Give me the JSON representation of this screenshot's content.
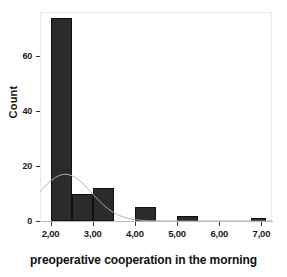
{
  "chart_data": {
    "type": "bar",
    "title": "",
    "subtitle": "",
    "xlabel": "preoperative cooperation in the morning",
    "ylabel": "Count",
    "xlim": [
      1.75,
      7.25
    ],
    "ylim": [
      0,
      76
    ],
    "grid": false,
    "legend": null,
    "bin_width": 0.5,
    "categories": [
      "2,00",
      "2,50",
      "3,00",
      "3,50",
      "4,00",
      "4,50",
      "5,00",
      "5,50",
      "6,00",
      "6,50",
      "7,00"
    ],
    "bins": [
      {
        "label": "2,00",
        "bin_start": 2.0,
        "bin_end": 2.5,
        "value": 74
      },
      {
        "label": "2,50",
        "bin_start": 2.5,
        "bin_end": 3.0,
        "value": 10
      },
      {
        "label": "3,00",
        "bin_start": 3.0,
        "bin_end": 3.5,
        "value": 12
      },
      {
        "label": "4,00",
        "bin_start": 4.0,
        "bin_end": 4.5,
        "value": 5
      },
      {
        "label": "5,00",
        "bin_start": 5.0,
        "bin_end": 5.5,
        "value": 2
      },
      {
        "label": "7,00",
        "bin_start": 6.75,
        "bin_end": 7.1,
        "value": 1
      }
    ],
    "values": [
      74,
      10,
      12,
      0,
      5,
      0,
      2,
      0,
      0,
      0,
      1
    ],
    "xticks": [
      "2,00",
      "3,00",
      "4,00",
      "5,00",
      "6,00",
      "7,00"
    ],
    "xtick_values": [
      2,
      3,
      4,
      5,
      6,
      7
    ],
    "yticks": [
      "0",
      "20",
      "40",
      "60"
    ],
    "ytick_values": [
      0,
      20,
      40,
      60
    ],
    "overlay": {
      "name": "normal-curve",
      "type": "line",
      "peak_x": 2.35,
      "peak_y": 17,
      "mean": 2.35,
      "sigma": 0.62,
      "color": "#b0b0b0"
    },
    "colors": {
      "bar_fill": "#2b2b2b",
      "bar_edge": "#111111",
      "axis": "#333333",
      "frame": "#e9e9e9",
      "curve": "#b0b0b0",
      "text": "#111111",
      "background": "#ffffff"
    }
  }
}
